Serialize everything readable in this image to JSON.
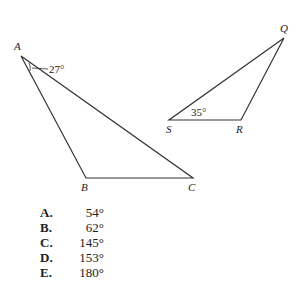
{
  "figure": {
    "triangle_abc": {
      "vertices": {
        "A": "A",
        "B": "B",
        "C": "C"
      },
      "angle_label": "27°"
    },
    "triangle_qrs": {
      "vertices": {
        "Q": "Q",
        "R": "R",
        "S": "S"
      },
      "angle_label": "35°"
    }
  },
  "choices": [
    {
      "letter": "A.",
      "value": "54°"
    },
    {
      "letter": "B.",
      "value": "62°"
    },
    {
      "letter": "C.",
      "value": "145°"
    },
    {
      "letter": "D.",
      "value": "153°"
    },
    {
      "letter": "E.",
      "value": "180°"
    }
  ]
}
